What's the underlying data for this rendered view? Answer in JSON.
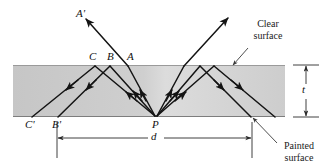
{
  "figure": {
    "background_color": "#ffffff",
    "slab": {
      "fill_color_left": "#c9c9c9",
      "fill_color_right": "#d7d7d7",
      "edge_color": "#8a8a8a",
      "x": 13,
      "y": 65,
      "width": 272,
      "height": 52
    },
    "ray_color": "#1a1a1a",
    "leader_color": "#444444"
  },
  "ray_labels": {
    "a_prime": "A'",
    "c": "C",
    "b": "B",
    "a": "A",
    "c_prime": "C'",
    "b_prime": "B'",
    "p": "P"
  },
  "dimension_labels": {
    "thickness": "t",
    "distance": "d"
  },
  "annotations": {
    "clear_surface": {
      "line1": "Clear",
      "line2": "surface"
    },
    "painted_surface": {
      "line1": "Painted",
      "line2": "surface"
    }
  }
}
